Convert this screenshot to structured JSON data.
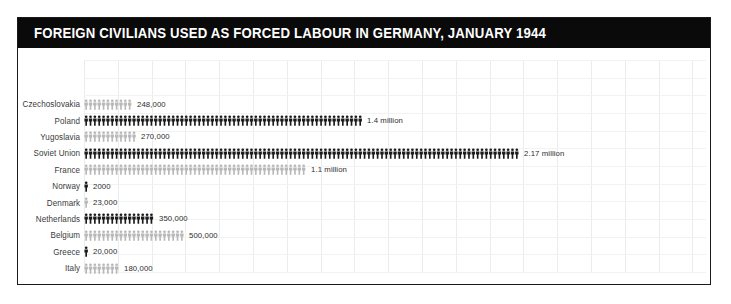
{
  "header": {
    "title": "FOREIGN CIVILIANS USED AS FORCED LABOUR IN GERMANY, JANUARY 1944",
    "background_color": "#0a0a0a",
    "text_color": "#ffffff"
  },
  "colors": {
    "dark_figure": "#1a1a1a",
    "light_figure": "#b8b8b8",
    "gridline": "#ececec",
    "label_text": "#3a3a3a",
    "value_text": "#2e2e2e",
    "frame_border": "#1a1a1a",
    "page_background": "#ffffff"
  },
  "chart_data": {
    "type": "bar",
    "title": "FOREIGN CIVILIANS USED AS FORCED LABOUR IN GERMANY, JANUARY 1944",
    "subtitle": "",
    "xlabel": "",
    "ylabel": "",
    "grid": true,
    "legend": "none",
    "pictogram": true,
    "units_per_pixel": 5000,
    "xlim": [
      0,
      2170000
    ],
    "categories": [
      "Czechoslovakia",
      "Poland",
      "Yugoslavia",
      "Soviet Union",
      "France",
      "Norway",
      "Denmark",
      "Netherlands",
      "Belgium",
      "Greece",
      "Italy"
    ],
    "values": [
      248000,
      1400000,
      270000,
      2170000,
      1100000,
      2000,
      23000,
      350000,
      500000,
      20000,
      180000
    ],
    "value_labels": [
      "248,000",
      "1.4 million",
      "270,000",
      "2.17 million",
      "1.1 million",
      "2000",
      "23,000",
      "350,000",
      "500,000",
      "20,000",
      "180,000"
    ],
    "shades": [
      "light",
      "dark",
      "light",
      "dark",
      "light",
      "dark",
      "light",
      "dark",
      "light",
      "dark",
      "light"
    ]
  }
}
